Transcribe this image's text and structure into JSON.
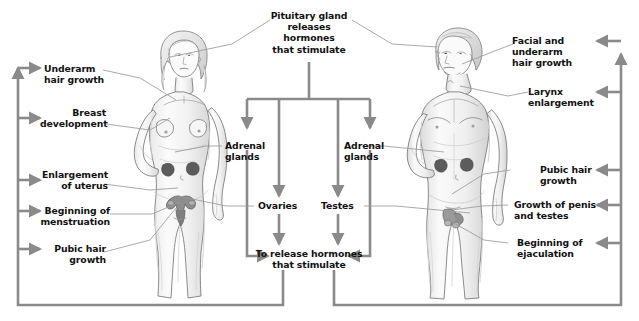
{
  "diagram": {
    "title_text": "Pituitary gland releases hormones that stimulate",
    "colors": {
      "flow_line": "#8a8a8a",
      "pointer_line": "#9b9b9b",
      "text": "#111111",
      "sketch_outline": "#6d6d6d",
      "sketch_shadow": "#cfcfcf",
      "background": "#ffffff"
    },
    "center": {
      "top_box": "Pituitary gland\nreleases\nhormones\nthat stimulate",
      "bottom_box": "To release hormones\nthat stimulate",
      "adrenal_left": "Adrenal\nglands",
      "adrenal_right": "Adrenal\nglands",
      "ovaries": "Ovaries",
      "testes": "Testes"
    },
    "female_effects": [
      {
        "id": "underarm-hair-growth",
        "text": "Underarm\nhair growth"
      },
      {
        "id": "breast-development",
        "text": "Breast\ndevelopment"
      },
      {
        "id": "enlargement-of-uterus",
        "text": "Enlargement\nof uterus"
      },
      {
        "id": "beginning-of-menstruation",
        "text": "Beginning of\nmenstruation"
      },
      {
        "id": "pubic-hair-growth",
        "text": "Pubic hair\ngrowth"
      }
    ],
    "male_effects": [
      {
        "id": "facial-and-underarm-hair-growth",
        "text": "Facial and\nunderarm\nhair growth"
      },
      {
        "id": "larynx-enlargement",
        "text": "Larynx\nenlargement"
      },
      {
        "id": "pubic-hair-growth",
        "text": "Pubic hair\ngrowth"
      },
      {
        "id": "growth-of-penis-and-testes",
        "text": "Growth of penis\nand testes"
      },
      {
        "id": "beginning-of-ejaculation",
        "text": "Beginning of\nejaculation"
      }
    ],
    "figures": {
      "female_label": "female-body-illustration",
      "male_label": "male-body-illustration"
    }
  }
}
